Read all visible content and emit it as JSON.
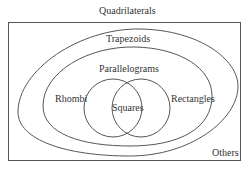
{
  "diagram": {
    "type": "venn-diagram",
    "title": "Quadrilaterals",
    "sets": [
      {
        "id": "quadrilaterals",
        "label": "Quadrilaterals"
      },
      {
        "id": "trapezoids",
        "label": "Trapezoids"
      },
      {
        "id": "parallelograms",
        "label": "Parallelograms"
      },
      {
        "id": "rhombi",
        "label": "Rhombi"
      },
      {
        "id": "rectangles",
        "label": "Rectangles"
      },
      {
        "id": "squares",
        "label": "Squares"
      },
      {
        "id": "others",
        "label": "Others"
      }
    ],
    "colors": {
      "stroke": "#555555",
      "text": "#333333",
      "background": "#ffffff"
    }
  }
}
